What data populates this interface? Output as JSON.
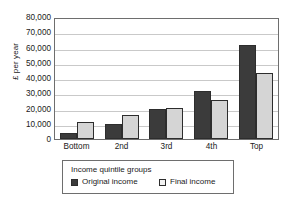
{
  "chart_data": {
    "type": "bar",
    "title": "",
    "xlabel": "Income quintile groups",
    "ylabel": "£ per year",
    "categories": [
      "Bottom",
      "2nd",
      "3rd",
      "4th",
      "Top"
    ],
    "series": [
      {
        "name": "Original income",
        "color": "#3b3b3b",
        "values": [
          4000,
          10000,
          20000,
          32000,
          63000
        ]
      },
      {
        "name": "Final income",
        "color": "#d5d5d5",
        "values": [
          11500,
          16000,
          21000,
          26000,
          44000
        ]
      }
    ],
    "ylim": [
      0,
      80000
    ],
    "ytick_step": 10000,
    "ytick_labels": [
      "80,000",
      "70,000",
      "60,000",
      "50,000",
      "40,000",
      "30,000",
      "20,000",
      "10,000",
      "0"
    ],
    "grid": true,
    "legend_position": "bottom",
    "legend_title": "Income quintile groups"
  },
  "axis": {
    "y_title": "£ per year"
  },
  "legend": {
    "title": "Income quintile groups",
    "items": [
      {
        "label": "Original income"
      },
      {
        "label": "Final income"
      }
    ]
  }
}
